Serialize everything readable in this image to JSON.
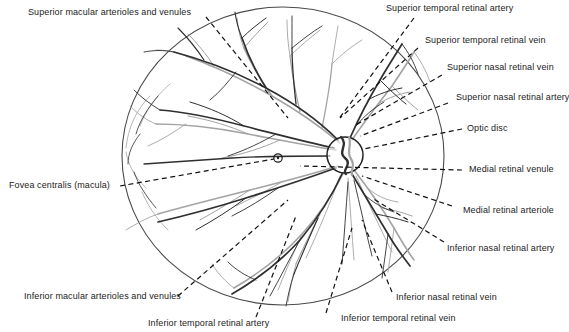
{
  "figure": {
    "colors": {
      "artery": "#2b2b2b",
      "vein": "#9a9a9a",
      "outline": "#4a4a4a",
      "leader": "#111111",
      "text": "#1b1b1b",
      "background": "#ffffff"
    },
    "retina_circle": {
      "cx": 283,
      "cy": 156,
      "rx": 161,
      "ry": 149
    },
    "optic_disc": {
      "cx": 345,
      "cy": 155,
      "r": 18
    },
    "fovea_marker": {
      "cx": 278,
      "cy": 158,
      "r": 4
    }
  },
  "labels": {
    "superior_macular": "Superior macular arterioles and venules",
    "superior_temporal_artery": "Superior temporal retinal artery",
    "superior_temporal_vein": "Superior temporal retinal vein",
    "superior_nasal_vein": "Superior nasal retinal vein",
    "superior_nasal_artery": "Superior nasal retinal artery",
    "optic_disc": "Optic disc",
    "medial_venule": "Medial retinal venule",
    "medial_arteriole": "Medial retinal arteriole",
    "inferior_nasal_artery": "Inferior nasal retinal artery",
    "inferior_nasal_vein": "Inferior nasal retinal vein",
    "inferior_temporal_vein": "Inferior temporal retinal vein",
    "inferior_temporal_artery": "Inferior temporal retinal artery",
    "inferior_macular": "Inferior macular arterioles and venules",
    "fovea": "Fovea centralis (macula)"
  }
}
